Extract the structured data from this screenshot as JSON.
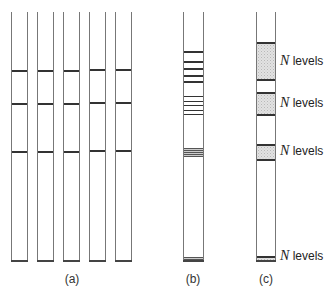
{
  "figure": {
    "panels": [
      {
        "id": "a",
        "caption": "(a)",
        "description": "Five identical columns each with three equally-placed energy level lines",
        "columns": 5,
        "level_y": [
          71,
          104,
          152
        ]
      },
      {
        "id": "b",
        "caption": "(b)",
        "description": "Single column with many irregularly spaced level lines and dense bands",
        "level_y": [
          51,
          61,
          68,
          75,
          81,
          96,
          101,
          105,
          110,
          114
        ],
        "dense_bands": [
          [
            148,
            157
          ],
          [
            257,
            261
          ]
        ]
      },
      {
        "id": "c",
        "caption": "(c)",
        "description": "Single column with shaded bands each containing N levels",
        "bands": [
          {
            "label_var": "N",
            "label_text": " levels",
            "top": 42,
            "bottom": 81
          },
          {
            "label_var": "N",
            "label_text": " levels",
            "top": 92,
            "bottom": 116
          },
          {
            "label_var": "N",
            "label_text": " levels",
            "top": 144,
            "bottom": 161
          },
          {
            "label_var": "N",
            "label_text": " levels",
            "top": 256,
            "bottom": 261
          }
        ]
      }
    ]
  }
}
